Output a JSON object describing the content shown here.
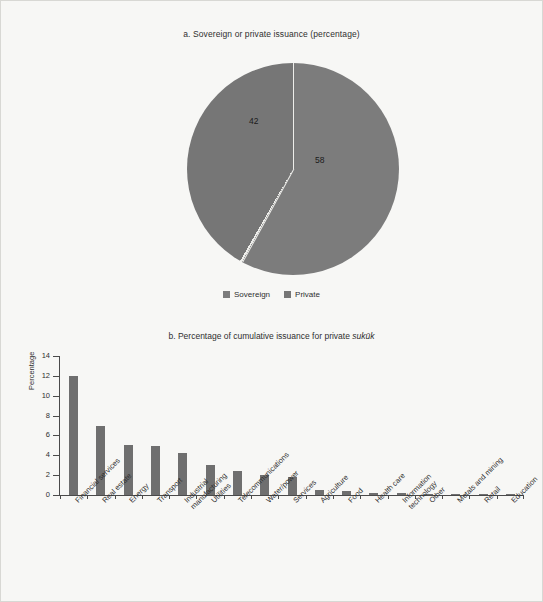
{
  "chart_data": [
    {
      "type": "pie",
      "title": "a. Sovereign or private issuance (percentage)",
      "labels": [
        "Sovereign",
        "Private"
      ],
      "values": [
        42,
        58
      ],
      "value_labels": [
        "42",
        "58"
      ],
      "colors": [
        "#7c7c7c",
        "#767676"
      ],
      "legend_position": "bottom",
      "unit": "percentage"
    },
    {
      "type": "bar",
      "title_prefix": "b. Percentage of cumulative issuance for private ",
      "title_italic": "sukūk",
      "ylabel": "Percentage",
      "xlabel": "",
      "ylim": [
        0,
        14
      ],
      "yticks": [
        0,
        2,
        4,
        6,
        8,
        10,
        12,
        14
      ],
      "grid": false,
      "bar_color": "#6f6f6f",
      "categories": [
        "Financial services",
        "Real estate",
        "Energy",
        "Transport",
        "Industrial\nmanufacturing",
        "Utilities",
        "Telecommunications",
        "Water/power",
        "Services",
        "Agriculture",
        "Food",
        "Health care",
        "Information\ntechnology",
        "Other",
        "Metals and mining",
        "Retail",
        "Education"
      ],
      "values": [
        12.0,
        7.0,
        5.0,
        4.9,
        4.2,
        3.0,
        2.4,
        2.0,
        1.8,
        0.5,
        0.45,
        0.2,
        0.2,
        0.15,
        0.12,
        0.05,
        0.03
      ]
    }
  ],
  "panel_a": {
    "title": "a. Sovereign or private issuance (percentage)",
    "legend": [
      {
        "label": "Sovereign",
        "color": "#7c7c7c"
      },
      {
        "label": "Private",
        "color": "#767676"
      }
    ],
    "slice_sovereign_value": "42",
    "slice_private_value": "58"
  },
  "panel_b": {
    "title_prefix": "b. Percentage of cumulative issuance for private ",
    "title_italic": "sukūk",
    "ylabel": "Percentage"
  }
}
